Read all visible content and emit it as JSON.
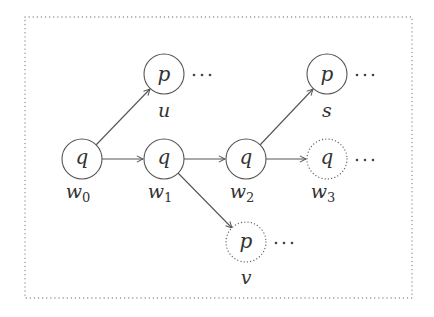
{
  "diagram": {
    "type": "tree of runs / states",
    "frame": {
      "style": "dotted",
      "x": 25,
      "y": 17,
      "width": 387,
      "height": 281
    },
    "colors": {
      "stroke": "#555555",
      "text": "#333333",
      "frame": "#888888"
    },
    "nodes": [
      {
        "id": "w0",
        "state": "q",
        "label": "w",
        "sub": "0",
        "cx": 82,
        "cy": 159,
        "style": "solid",
        "continues": false
      },
      {
        "id": "w1",
        "state": "q",
        "label": "w",
        "sub": "1",
        "cx": 164,
        "cy": 159,
        "style": "solid",
        "continues": false
      },
      {
        "id": "w2",
        "state": "q",
        "label": "w",
        "sub": "2",
        "cx": 246,
        "cy": 159,
        "style": "solid",
        "continues": false
      },
      {
        "id": "w3",
        "state": "q",
        "label": "w",
        "sub": "3",
        "cx": 327,
        "cy": 159,
        "style": "dotted",
        "continues": true
      },
      {
        "id": "u",
        "state": "p",
        "label": "u",
        "sub": "",
        "cx": 164,
        "cy": 74,
        "style": "solid",
        "continues": true
      },
      {
        "id": "s",
        "state": "p",
        "label": "s",
        "sub": "",
        "cx": 327,
        "cy": 74,
        "style": "solid",
        "continues": true
      },
      {
        "id": "v",
        "state": "p",
        "label": "v",
        "sub": "",
        "cx": 246,
        "cy": 242,
        "style": "dotted",
        "continues": true
      }
    ],
    "edges": [
      {
        "from": "w0",
        "to": "u"
      },
      {
        "from": "w0",
        "to": "w1"
      },
      {
        "from": "w1",
        "to": "w2"
      },
      {
        "from": "w1",
        "to": "v"
      },
      {
        "from": "w2",
        "to": "s"
      },
      {
        "from": "w2",
        "to": "w3"
      }
    ],
    "ellipsis": "···"
  },
  "text": {
    "w0_state": "q",
    "w0_label": "w",
    "w0_sub": "0",
    "w1_state": "q",
    "w1_label": "w",
    "w1_sub": "1",
    "w2_state": "q",
    "w2_label": "w",
    "w2_sub": "2",
    "w3_state": "q",
    "w3_label": "w",
    "w3_sub": "3",
    "u_state": "p",
    "u_label": "u",
    "s_state": "p",
    "s_label": "s",
    "v_state": "p",
    "v_label": "v"
  }
}
